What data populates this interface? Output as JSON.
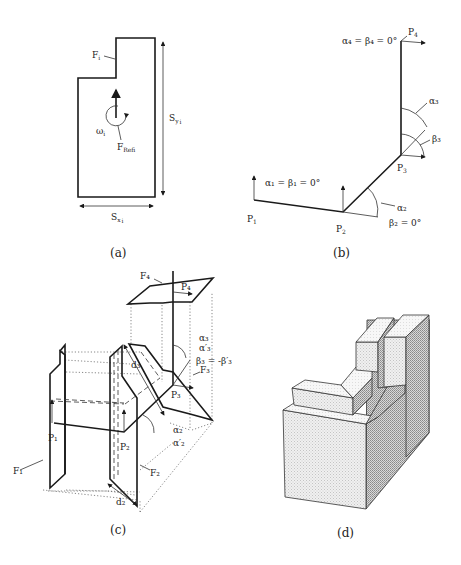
{
  "figure": {
    "panels": [
      {
        "id": "a",
        "caption": "(a)",
        "labels": {
          "face": "F",
          "face_sub": "i",
          "omega": "ω",
          "omega_sub": "i",
          "fref": "F",
          "fref_sub": "Ref",
          "fref_sub2": "i",
          "sy": "S",
          "sy_sub": "y",
          "sy_sub2": "i",
          "sx": "S",
          "sx_sub": "x",
          "sx_sub2": "i"
        }
      },
      {
        "id": "b",
        "caption": "(b)",
        "labels": {
          "p1": "P",
          "p1_sub": "1",
          "p2": "P",
          "p2_sub": "2",
          "p3": "P",
          "p3_sub": "3",
          "p4": "P",
          "p4_sub": "4",
          "eq1": "α₁ = β₁ = 0°",
          "eq4": "α₄ = β₄ = 0°",
          "eq2b": "β₂ = 0°",
          "a2": "α₂",
          "a3": "α₃",
          "b3": "β₃"
        }
      },
      {
        "id": "c",
        "caption": "(c)",
        "labels": {
          "f1": "F₁",
          "f2": "F₂",
          "f3": "F₃",
          "f4": "F₄",
          "p1": "P₁",
          "p2": "P₂",
          "p3": "P₃",
          "p4": "P₄",
          "d2": "d₂",
          "d3": "d₃",
          "a2": "α₂",
          "a2p": "α′₂",
          "a3": "α₃",
          "a3p": "α′₃",
          "b3": "β₃ = -β′₃"
        }
      },
      {
        "id": "d",
        "caption": "(d)"
      }
    ]
  }
}
